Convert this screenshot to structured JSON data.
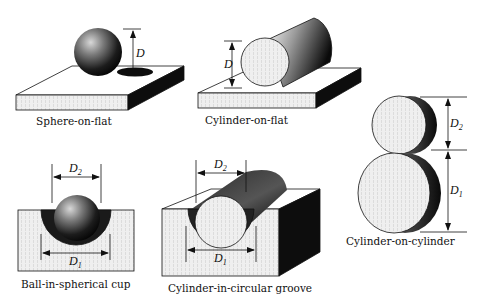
{
  "figure": {
    "panels": [
      {
        "id": "sphere-on-flat",
        "caption": "Sphere-on-flat",
        "dimensions": [
          "D"
        ]
      },
      {
        "id": "cylinder-on-flat",
        "caption": "Cylinder-on-flat",
        "dimensions": [
          "D"
        ]
      },
      {
        "id": "cylinder-on-cylinder",
        "caption": "Cylinder-on-cylinder",
        "dimensions": [
          "D2",
          "D1"
        ]
      },
      {
        "id": "ball-in-spherical-cup",
        "caption": "Ball-in-spherical cup",
        "dimensions": [
          "D2",
          "D1"
        ]
      },
      {
        "id": "cylinder-in-circular-groove",
        "caption": "Cylinder-in-circular groove",
        "dimensions": [
          "D2",
          "D1"
        ]
      }
    ],
    "labels": {
      "D": "D",
      "D_letter": "D",
      "sub1": "1",
      "sub2": "2"
    },
    "colors": {
      "ink": "#111111",
      "light_face": "#ececec",
      "dark_face": "#0d0d0d"
    }
  }
}
